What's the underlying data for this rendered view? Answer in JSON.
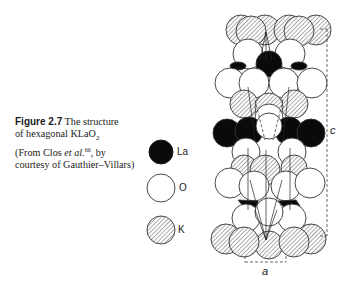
{
  "caption": {
    "figure_label": "Figure 2.7",
    "line1_rest": " The structure",
    "line2": "of hexagonal KLaO",
    "line2_sub": "2",
    "line3_pre": "(From Clos ",
    "line3_italic": "et al.",
    "line3_sup": "66",
    "line3_post": ", by",
    "line4": "courtesy of Gauthier–Villars)"
  },
  "legend": {
    "items": [
      {
        "label": "La",
        "style": "filled-black"
      },
      {
        "label": "O",
        "style": "open-white"
      },
      {
        "label": "K",
        "style": "hatched"
      }
    ]
  },
  "diagram": {
    "axis_c_label": "c",
    "axis_a_label": "a"
  }
}
